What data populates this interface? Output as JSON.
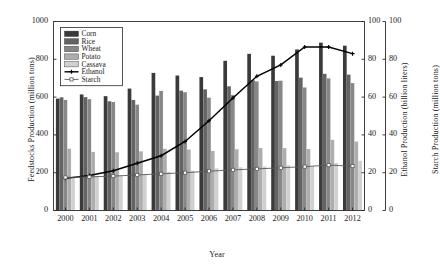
{
  "chart_data": {
    "type": "bar",
    "title": "",
    "xlabel": "Year",
    "ylabel": "Feedstocks Production (million tons)",
    "ylabel_secondary": "Ethanol Production (billion liters)",
    "ylabel_tertiary": "Starch Production (million tons)",
    "ylim": [
      0,
      1000
    ],
    "ylim_secondary": [
      0,
      100
    ],
    "ylim_tertiary": [
      0,
      100
    ],
    "yticks": [
      0,
      200,
      400,
      600,
      800,
      1000
    ],
    "yticks_secondary": [
      0,
      20,
      40,
      60,
      80,
      100
    ],
    "yticks_tertiary": [
      0,
      20,
      40,
      60,
      80,
      100
    ],
    "grid": false,
    "legend_position": "upper-left",
    "categories": [
      "2000",
      "2001",
      "2002",
      "2003",
      "2004",
      "2005",
      "2006",
      "2007",
      "2008",
      "2009",
      "2010",
      "2011",
      "2012"
    ],
    "series": [
      {
        "name": "Corn",
        "kind": "bar",
        "color": "#3a3a3a",
        "axis": "left",
        "values": [
          592,
          614,
          605,
          645,
          728,
          714,
          706,
          792,
          829,
          819,
          852,
          888,
          872
        ]
      },
      {
        "name": "Rice",
        "kind": "bar",
        "color": "#636363",
        "axis": "left",
        "values": [
          599,
          600,
          578,
          585,
          608,
          634,
          641,
          657,
          689,
          685,
          703,
          723,
          719
        ]
      },
      {
        "name": "Wheat",
        "kind": "bar",
        "color": "#878787",
        "axis": "left",
        "values": [
          585,
          589,
          574,
          560,
          633,
          626,
          597,
          611,
          683,
          687,
          651,
          699,
          674
        ]
      },
      {
        "name": "Potato",
        "kind": "bar",
        "color": "#adadad",
        "axis": "left",
        "values": [
          327,
          310,
          308,
          313,
          327,
          322,
          315,
          324,
          331,
          330,
          325,
          374,
          365
        ]
      },
      {
        "name": "Cassava",
        "kind": "bar",
        "color": "#d0d0d0",
        "axis": "left",
        "values": [
          177,
          182,
          185,
          193,
          205,
          210,
          223,
          229,
          233,
          240,
          234,
          252,
          263
        ]
      },
      {
        "name": "Ethanol",
        "kind": "line",
        "marker": "plus",
        "color": "#000000",
        "axis": "right-1",
        "values": [
          17.0,
          18.5,
          21.0,
          25.0,
          29.0,
          36.5,
          47.5,
          59.5,
          71.0,
          77.0,
          86.5,
          86.5,
          83.0
        ]
      },
      {
        "name": "Starch",
        "kind": "line",
        "marker": "square",
        "color": "#5a5a5a",
        "axis": "right-2",
        "values": [
          17.5,
          17.8,
          18.2,
          18.8,
          19.4,
          20.0,
          20.8,
          21.5,
          22.0,
          22.6,
          23.2,
          24.0,
          23.5
        ]
      }
    ]
  },
  "legend": {
    "items": [
      "Corn",
      "Rice",
      "Wheat",
      "Potato",
      "Cassava",
      "Ethanol",
      "Starch"
    ]
  },
  "axes": {
    "left_title": "Feedstocks Production (million tons)",
    "mid_title": "Ethanol Production (billion liters)",
    "right_title": "Starch Production (million tons)",
    "x_title": "Year",
    "left_ticks": [
      "0",
      "200",
      "400",
      "600",
      "800",
      "1000"
    ],
    "mid_ticks": [
      "0",
      "20",
      "40",
      "60",
      "80",
      "100"
    ],
    "right_ticks": [
      "0",
      "20",
      "40",
      "60",
      "80",
      "100"
    ],
    "x_ticks": [
      "2000",
      "2001",
      "2002",
      "2003",
      "2004",
      "2005",
      "2006",
      "2007",
      "2008",
      "2009",
      "2010",
      "2011",
      "2012"
    ]
  }
}
